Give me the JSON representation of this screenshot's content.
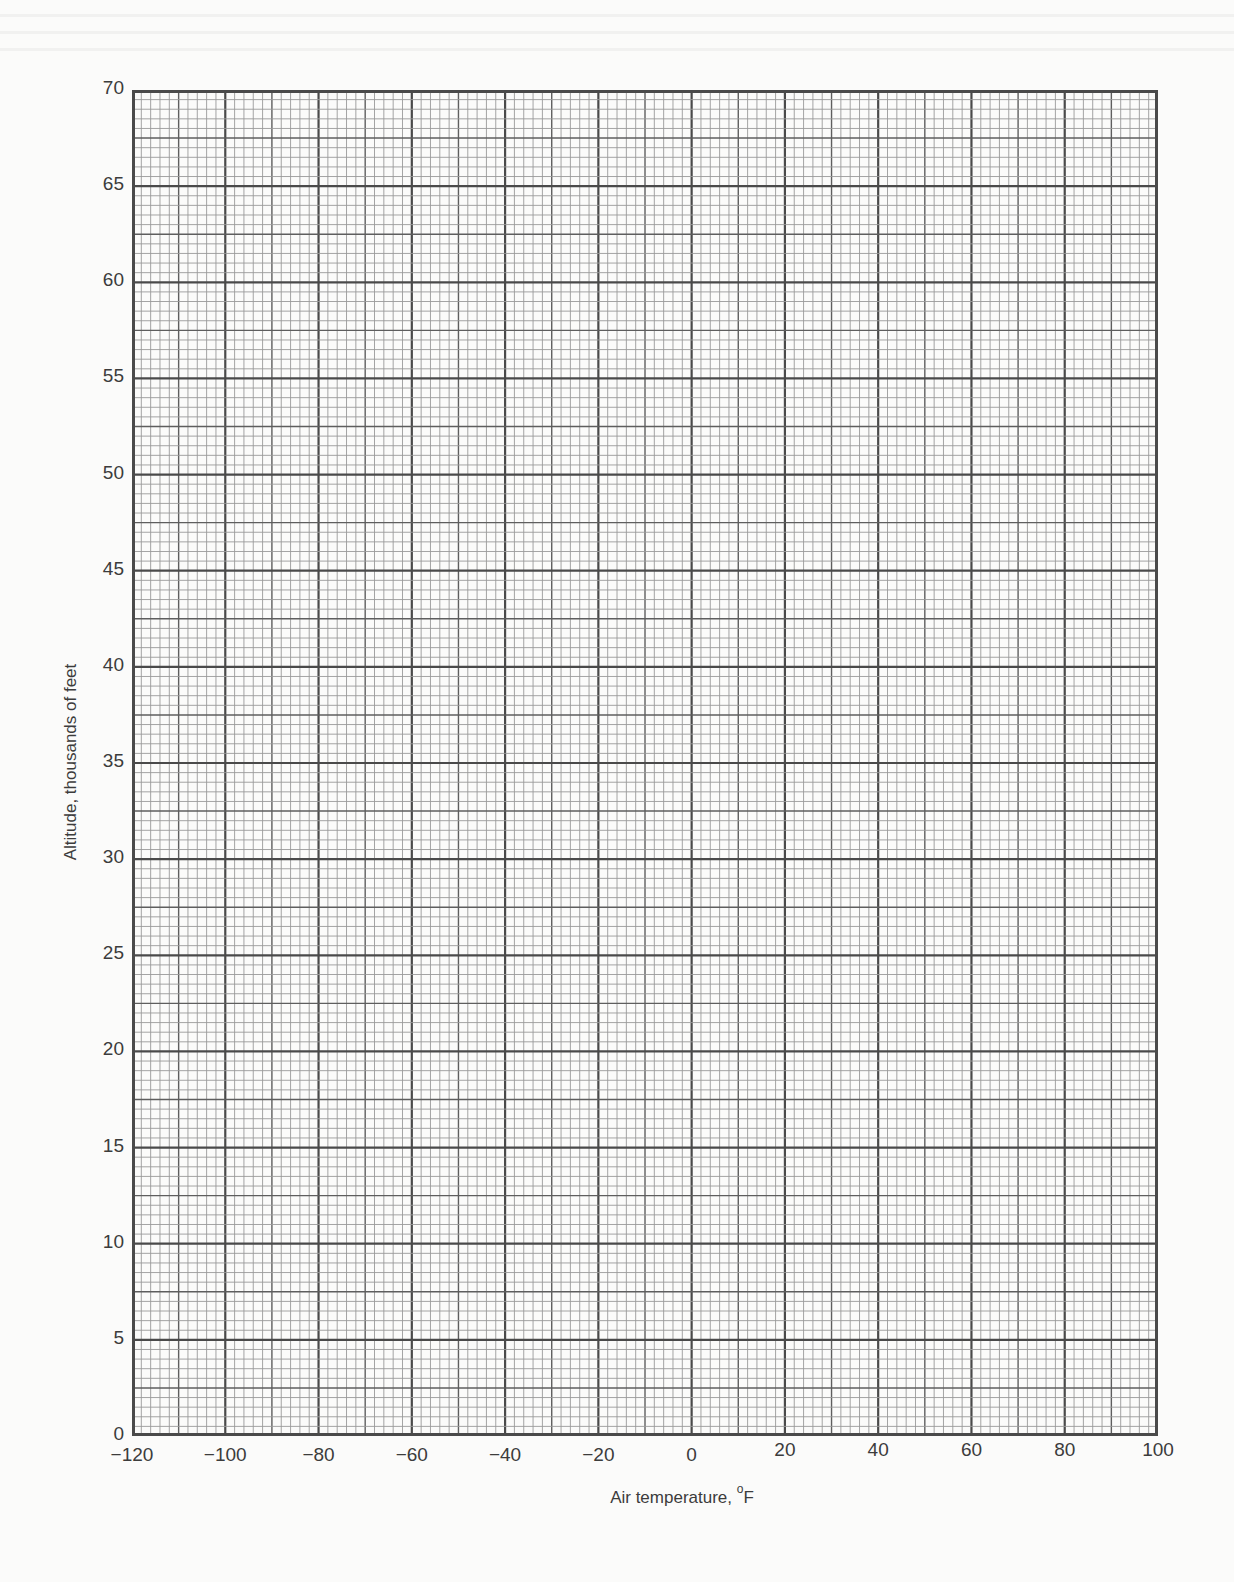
{
  "chart_data": {
    "type": "line",
    "title": "",
    "xlabel": "Air temperature, °F",
    "xlabel_text": "Air temperature,",
    "xlabel_unit_degree": "o",
    "xlabel_unit": "F",
    "ylabel": "Altitude, thousands of feet",
    "xlim": [
      -120,
      100
    ],
    "ylim": [
      0,
      70
    ],
    "x_ticks": [
      -120,
      -100,
      -80,
      -60,
      -40,
      -20,
      0,
      20,
      40,
      60,
      80,
      100
    ],
    "x_tick_labels": [
      "−120",
      "−100",
      "−80",
      "−60",
      "−40",
      "−20",
      "0",
      "20",
      "40",
      "60",
      "80",
      "100"
    ],
    "y_ticks": [
      0,
      5,
      10,
      15,
      20,
      25,
      30,
      35,
      40,
      45,
      50,
      55,
      60,
      65,
      70
    ],
    "y_tick_labels": [
      "0",
      "5",
      "10",
      "15",
      "20",
      "25",
      "30",
      "35",
      "40",
      "45",
      "50",
      "55",
      "60",
      "65",
      "70"
    ],
    "grid": true,
    "grid_spacing": {
      "x_major": 20,
      "x_medium": 10,
      "x_minor": 2,
      "y_major": 5,
      "y_medium": 2.5,
      "y_minor": 0.5
    },
    "series": [],
    "legend": null,
    "note": "Blank graph paper worksheet; no data plotted"
  },
  "colors": {
    "background": "#fbfbfa",
    "major_line": "#4a4a4a",
    "medium_line": "#5e5e5e",
    "minor_line": "#9a9a9a",
    "text": "#3c3c3c"
  }
}
